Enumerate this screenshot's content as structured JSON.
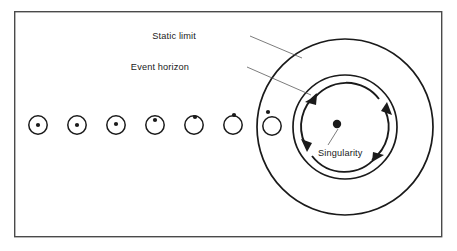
{
  "figure": {
    "background_color": "#ffffff",
    "ink_color": "#1a1a1a",
    "frame_color": "#4a4a4a",
    "frame": {
      "x": 14,
      "y": 11,
      "width": 428,
      "height": 226
    }
  },
  "labels": {
    "static_limit": "Static limit",
    "event_horizon": "Event horizon",
    "singularity": "Singularity"
  },
  "diagram": {
    "static_limit_circle": {
      "cx": 345,
      "cy": 127,
      "r": 88
    },
    "event_horizon_circle": {
      "cx": 345,
      "cy": 127,
      "r": 52
    },
    "singularity_point": {
      "cx": 337,
      "cy": 124,
      "r": 4.2
    },
    "rotation_direction": "clockwise",
    "rotation_arrow_radius": 41,
    "collapse_sequence": [
      {
        "cx": 38,
        "cy": 125,
        "r": 9.2,
        "dot_x": 38,
        "dot_y": 125,
        "dot_r": 2.1
      },
      {
        "cx": 77,
        "cy": 125,
        "r": 9.2,
        "dot_x": 77,
        "dot_y": 125,
        "dot_r": 2.1
      },
      {
        "cx": 116,
        "cy": 125,
        "r": 9.2,
        "dot_x": 116,
        "dot_y": 124,
        "dot_r": 2.1
      },
      {
        "cx": 155,
        "cy": 125,
        "r": 9.2,
        "dot_x": 155,
        "dot_y": 120,
        "dot_r": 2.1
      },
      {
        "cx": 194,
        "cy": 125,
        "r": 9.2,
        "dot_x": 195,
        "dot_y": 117,
        "dot_r": 2.1
      },
      {
        "cx": 233,
        "cy": 125,
        "r": 9.2,
        "dot_x": 234,
        "dot_y": 115,
        "dot_r": 2.1
      },
      {
        "cx": 272,
        "cy": 126,
        "r": 9.2,
        "dot_x": 268,
        "dot_y": 112,
        "dot_r": 2.1
      }
    ],
    "leader_lines": [
      {
        "name": "static-limit-leader",
        "x1": 250,
        "y1": 36,
        "x2": 300,
        "y2": 57
      },
      {
        "name": "event-horizon-leader",
        "x1": 247,
        "y1": 67,
        "x2": 310,
        "y2": 94
      },
      {
        "name": "singularity-leader",
        "x1": 338,
        "y1": 129,
        "x2": 328,
        "y2": 144
      }
    ],
    "label_positions": {
      "static_limit": {
        "x": 196,
        "y": 39
      },
      "event_horizon": {
        "x": 188,
        "y": 70
      },
      "singularity": {
        "x": 318,
        "y": 155
      }
    }
  }
}
